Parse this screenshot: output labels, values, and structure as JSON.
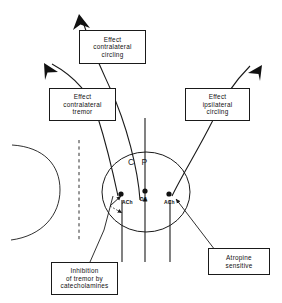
{
  "figure": {
    "title": "",
    "region_label": "C P",
    "background_color": "#ffffff",
    "stroke_color": "#1a1a1a"
  },
  "callouts": [
    {
      "id": "effect-contralateral-circling",
      "lines": [
        "Effect",
        "contralateral",
        "circling"
      ],
      "line1": "Effect",
      "line2": "contralateral",
      "line3": "circling"
    },
    {
      "id": "effect-contralateral-tremor",
      "lines": [
        "Effect",
        "contralateral",
        "tremor"
      ],
      "line1": "Effect",
      "line2": "contralateral",
      "line3": "tremor"
    },
    {
      "id": "effect-ipsilateral-circling",
      "lines": [
        "Effect",
        "ipsilateral",
        "circling"
      ],
      "line1": "Effect",
      "line2": "ipsilateral",
      "line3": "circling"
    },
    {
      "id": "inhibition-of-tremor",
      "lines": [
        "Inhibition",
        "of tremor by",
        "catecholamines"
      ],
      "line1": "Inhibition",
      "line2": "of tremor by",
      "line3": "catecholamines"
    },
    {
      "id": "atropine-sensitive",
      "lines": [
        "Atropine",
        "sensitive"
      ],
      "line1": "Atropine",
      "line2": "sensitive"
    }
  ],
  "neurotransmitters": [
    {
      "id": "ach-left",
      "label": "ACh"
    },
    {
      "id": "da-center",
      "label": "DA"
    },
    {
      "id": "ach-right",
      "label": "ACh"
    }
  ],
  "icons": {
    "arrowhead": "arrowhead-icon",
    "terminal_dot": "synaptic-terminal-dot-icon",
    "midline": "dashed-midline-icon",
    "contralateral_arc": "contralateral-hemisphere-arc-icon",
    "cp_ellipse": "caudate-putamen-ellipse-icon"
  }
}
